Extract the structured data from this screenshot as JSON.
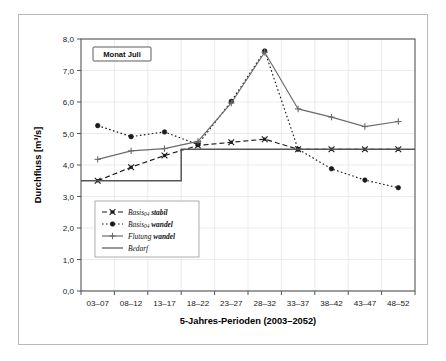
{
  "figure": {
    "annotation": "Monat Juli",
    "background_color": "#ffffff",
    "frame_color": "#b9b9b9"
  },
  "chart_data": {
    "type": "line",
    "title": "",
    "xlabel": "5-Jahres-Perioden (2003–2052)",
    "ylabel": "Durchfluss [m³/s]",
    "categories": [
      "03–07",
      "08–12",
      "13–17",
      "18–22",
      "23–27",
      "28–32",
      "33–37",
      "38–42",
      "43–47",
      "48–52"
    ],
    "xlim": [
      0,
      9
    ],
    "ylim": [
      0.0,
      8.0
    ],
    "ytick_labels": [
      "0,0",
      "1,0",
      "2,0",
      "3,0",
      "4,0",
      "5,0",
      "6,0",
      "7,0",
      "8,0"
    ],
    "ytick_values": [
      0.0,
      1.0,
      2.0,
      3.0,
      4.0,
      5.0,
      6.0,
      7.0,
      8.0
    ],
    "grid": true,
    "legend_position": "lower-left-inside",
    "series": [
      {
        "name": "Basis_04 stabil",
        "label_main": "Basis",
        "label_sub": "04",
        "label_tail": "stabil",
        "style": "dashed",
        "marker": "x-dot",
        "color": "#1a1a1a",
        "values": [
          3.5,
          3.93,
          4.3,
          4.62,
          4.72,
          4.82,
          4.5,
          4.5,
          4.5,
          4.5
        ]
      },
      {
        "name": "Basis_04 wandel",
        "label_main": "Basis",
        "label_sub": "04",
        "label_tail": "wandel",
        "style": "dotted",
        "marker": "dot",
        "color": "#1a1a1a",
        "values": [
          5.25,
          4.9,
          5.05,
          4.65,
          6.02,
          7.62,
          4.5,
          3.88,
          3.52,
          3.28
        ]
      },
      {
        "name": "Flutung wandel",
        "label_main": "Flutung",
        "label_sub": "",
        "label_tail": "wandel",
        "style": "solid",
        "marker": "plus",
        "color": "#6b6b6b",
        "values": [
          4.18,
          4.45,
          4.52,
          4.75,
          5.97,
          7.58,
          5.78,
          5.52,
          5.22,
          5.38
        ]
      },
      {
        "name": "Bedarf",
        "label_main": "Bedarf",
        "label_sub": "",
        "label_tail": "",
        "style": "step",
        "marker": "none",
        "color": "#555555",
        "values": [
          3.5,
          3.5,
          3.5,
          4.5,
          4.5,
          4.5,
          4.5,
          4.5,
          4.5,
          4.5
        ]
      }
    ]
  },
  "legend": {
    "entries": [
      {
        "label_main": "Basis",
        "label_sub": "04",
        "label_tail": "stabil",
        "style": "dashed",
        "marker": "x-dot"
      },
      {
        "label_main": "Basis",
        "label_sub": "04",
        "label_tail": "wandel",
        "style": "dotted",
        "marker": "dot"
      },
      {
        "label_main": "Flutung",
        "label_sub": "",
        "label_tail": "wandel",
        "style": "solid",
        "marker": "plus"
      },
      {
        "label_main": "Bedarf",
        "label_sub": "",
        "label_tail": "",
        "style": "solid-plain",
        "marker": "none"
      }
    ]
  }
}
